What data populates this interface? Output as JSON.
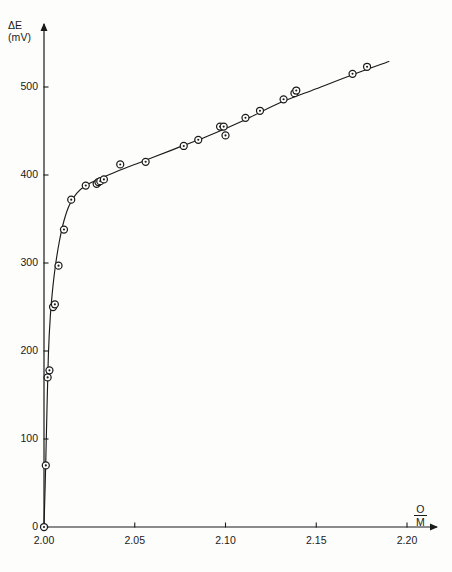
{
  "chart_data": {
    "type": "scatter",
    "title": "",
    "subtitle": "",
    "xlabel": "O/M",
    "xlabel_numerator": "O",
    "xlabel_denominator": "M",
    "ylabel": "ΔE (mV)",
    "ylabel_symbol": "ΔE",
    "ylabel_unit": "(mV)",
    "xlim": [
      2.0,
      2.2
    ],
    "ylim": [
      0,
      560
    ],
    "xticks": [
      2.0,
      2.05,
      2.1,
      2.15,
      2.2
    ],
    "xtick_labels": [
      "2.00",
      "2.05",
      "2.10",
      "2.15",
      "2.20"
    ],
    "yticks": [
      0,
      100,
      200,
      300,
      400,
      500
    ],
    "ytick_labels": [
      "0",
      "100",
      "200",
      "300",
      "400",
      "500"
    ],
    "grid": false,
    "legend": null,
    "marker": "open-circle-with-center-dot",
    "line_style": "solid",
    "line_color": "#1a1a1a",
    "marker_color": "#1a1a1a",
    "annotations": [],
    "x": [
      2.0,
      2.001,
      2.002,
      2.003,
      2.005,
      2.006,
      2.008,
      2.011,
      2.015,
      2.023,
      2.029,
      2.03,
      2.031,
      2.033,
      2.042,
      2.056,
      2.077,
      2.085,
      2.097,
      2.099,
      2.1,
      2.111,
      2.119,
      2.132,
      2.138,
      2.139,
      2.17,
      2.178
    ],
    "y": [
      0,
      70,
      170,
      178,
      250,
      253,
      297,
      338,
      372,
      388,
      390,
      392,
      393,
      395,
      412,
      415,
      433,
      440,
      455,
      455,
      445,
      465,
      473,
      486,
      493,
      496,
      515,
      523
    ],
    "points": [
      {
        "x": 2.0,
        "y": 0
      },
      {
        "x": 2.001,
        "y": 70
      },
      {
        "x": 2.002,
        "y": 170
      },
      {
        "x": 2.003,
        "y": 178
      },
      {
        "x": 2.005,
        "y": 250
      },
      {
        "x": 2.006,
        "y": 253
      },
      {
        "x": 2.008,
        "y": 297
      },
      {
        "x": 2.011,
        "y": 338
      },
      {
        "x": 2.015,
        "y": 372
      },
      {
        "x": 2.023,
        "y": 388
      },
      {
        "x": 2.029,
        "y": 390
      },
      {
        "x": 2.03,
        "y": 392
      },
      {
        "x": 2.031,
        "y": 393
      },
      {
        "x": 2.033,
        "y": 395
      },
      {
        "x": 2.042,
        "y": 412
      },
      {
        "x": 2.056,
        "y": 415
      },
      {
        "x": 2.077,
        "y": 433
      },
      {
        "x": 2.085,
        "y": 440
      },
      {
        "x": 2.097,
        "y": 455
      },
      {
        "x": 2.099,
        "y": 455
      },
      {
        "x": 2.1,
        "y": 445
      },
      {
        "x": 2.111,
        "y": 465
      },
      {
        "x": 2.119,
        "y": 473
      },
      {
        "x": 2.132,
        "y": 486
      },
      {
        "x": 2.138,
        "y": 493
      },
      {
        "x": 2.139,
        "y": 496
      },
      {
        "x": 2.17,
        "y": 515
      },
      {
        "x": 2.178,
        "y": 523
      }
    ],
    "curve": [
      {
        "x": 2.0,
        "y": 0
      },
      {
        "x": 2.0008,
        "y": 60
      },
      {
        "x": 2.0016,
        "y": 130
      },
      {
        "x": 2.0024,
        "y": 195
      },
      {
        "x": 2.0035,
        "y": 240
      },
      {
        "x": 2.005,
        "y": 275
      },
      {
        "x": 2.0065,
        "y": 300
      },
      {
        "x": 2.0085,
        "y": 325
      },
      {
        "x": 2.011,
        "y": 348
      },
      {
        "x": 2.014,
        "y": 366
      },
      {
        "x": 2.018,
        "y": 379
      },
      {
        "x": 2.023,
        "y": 388
      },
      {
        "x": 2.03,
        "y": 395
      },
      {
        "x": 2.04,
        "y": 404
      },
      {
        "x": 2.055,
        "y": 416
      },
      {
        "x": 2.07,
        "y": 428
      },
      {
        "x": 2.09,
        "y": 444
      },
      {
        "x": 2.11,
        "y": 462
      },
      {
        "x": 2.13,
        "y": 482
      },
      {
        "x": 2.15,
        "y": 498
      },
      {
        "x": 2.17,
        "y": 514
      },
      {
        "x": 2.19,
        "y": 529
      }
    ]
  }
}
